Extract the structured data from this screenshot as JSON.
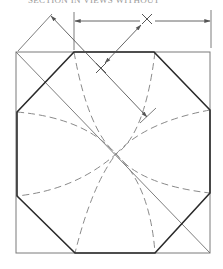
{
  "header": {
    "caption": "SECTION IN VIEWS WITHOUT"
  },
  "diagram": {
    "type": "technical-drawing",
    "colors": {
      "object_line": "#2a2a2a",
      "thin_line": "#6e6e6e",
      "hidden_line": "#8a8a8a",
      "background": "#ffffff"
    },
    "square": {
      "x1": 16,
      "y1": 52,
      "x2": 210,
      "y2": 253
    },
    "octagon_vertices": [
      [
        74,
        52
      ],
      [
        154,
        52
      ],
      [
        210,
        110
      ],
      [
        210,
        193
      ],
      [
        155,
        253
      ],
      [
        75,
        253
      ],
      [
        17,
        196
      ],
      [
        17,
        112
      ]
    ],
    "center": [
      116,
      154
    ],
    "marks": [
      {
        "name": "x-mark-top",
        "symbol": "×",
        "x": 147,
        "y": 19
      },
      {
        "name": "x-mark-inner",
        "symbol": "×",
        "x": 101,
        "y": 68
      }
    ],
    "dimensions": {
      "horizontal_width": "X",
      "diagonal": "X"
    }
  }
}
